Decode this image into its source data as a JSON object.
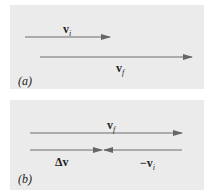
{
  "colors": {
    "panel_bg": "#ebebeb",
    "arrow": "#666666",
    "text": "#222222"
  },
  "panel_a": {
    "label": "(a)",
    "vectors": [
      {
        "name": "v_i",
        "symbol": "v",
        "subscript": "i",
        "x1": 15,
        "x2": 100,
        "y": 32,
        "direction": "right"
      },
      {
        "name": "v_f",
        "symbol": "v",
        "subscript": "f",
        "x1": 30,
        "x2": 182,
        "y": 52,
        "direction": "right"
      }
    ]
  },
  "panel_b": {
    "label": "(b)",
    "vectors": [
      {
        "name": "v_f",
        "symbol": "v",
        "subscript": "f",
        "x1": 20,
        "x2": 172,
        "y": 33,
        "direction": "right"
      },
      {
        "name": "delta_v",
        "symbol": "Δv",
        "subscript": "",
        "x1": 20,
        "x2": 92,
        "y": 50,
        "direction": "right"
      },
      {
        "name": "neg_v_i",
        "symbol": "−v",
        "subscript": "i",
        "x1": 172,
        "x2": 92,
        "y": 50,
        "direction": "left"
      }
    ]
  },
  "text": {
    "vi_symbol": "v",
    "vi_sub": "i",
    "vf_symbol": "v",
    "vf_sub": "f",
    "dv_symbol": "Δv",
    "negvi_symbol": "−v",
    "negvi_sub": "i",
    "a_label": "(a)",
    "b_label": "(b)"
  }
}
